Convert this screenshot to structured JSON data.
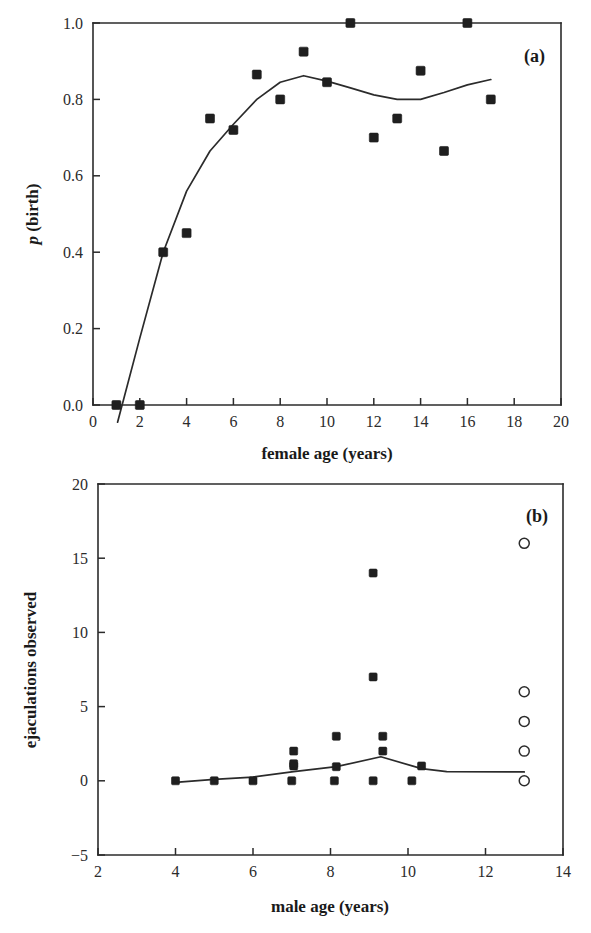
{
  "figure": {
    "background": "#ffffff",
    "ink_color": "#1f1f1f",
    "panel_count": 2
  },
  "chart_data": [
    {
      "panel": "a",
      "tag": "(a)",
      "type": "scatter",
      "title": "",
      "xlabel": "female age (years)",
      "ylabel": "p (birth)",
      "ylabel_parts": {
        "italic": "p",
        "rest": " (birth)"
      },
      "xlim": [
        0,
        20
      ],
      "ylim": [
        0.0,
        1.0
      ],
      "xticks": [
        0,
        2,
        4,
        6,
        8,
        10,
        12,
        14,
        16,
        18,
        20
      ],
      "xticklabels": [
        "0",
        "2",
        "4",
        "6",
        "8",
        "10",
        "12",
        "14",
        "16",
        "18",
        "20"
      ],
      "yticks": [
        0.0,
        0.2,
        0.4,
        0.6,
        0.8,
        1.0
      ],
      "yticklabels": [
        "0.0",
        "0.2",
        "0.4",
        "0.6",
        "0.8",
        "1.0"
      ],
      "grid": false,
      "legend": "none",
      "marker": "filled-square",
      "points": [
        {
          "x": 1,
          "y": 0.0
        },
        {
          "x": 2,
          "y": 0.0
        },
        {
          "x": 3,
          "y": 0.4
        },
        {
          "x": 4,
          "y": 0.45
        },
        {
          "x": 5,
          "y": 0.75
        },
        {
          "x": 6,
          "y": 0.72
        },
        {
          "x": 7,
          "y": 0.865
        },
        {
          "x": 8,
          "y": 0.8
        },
        {
          "x": 9,
          "y": 0.925
        },
        {
          "x": 10,
          "y": 0.845
        },
        {
          "x": 11,
          "y": 1.0
        },
        {
          "x": 12,
          "y": 0.7
        },
        {
          "x": 13,
          "y": 0.75
        },
        {
          "x": 14,
          "y": 0.875
        },
        {
          "x": 15,
          "y": 0.665
        },
        {
          "x": 16,
          "y": 1.0
        },
        {
          "x": 17,
          "y": 0.8
        }
      ],
      "fit_line": [
        {
          "x": 1.05,
          "y": -0.045
        },
        {
          "x": 2.0,
          "y": 0.175
        },
        {
          "x": 3.0,
          "y": 0.4
        },
        {
          "x": 4.0,
          "y": 0.56
        },
        {
          "x": 5.0,
          "y": 0.665
        },
        {
          "x": 6.0,
          "y": 0.735
        },
        {
          "x": 7.0,
          "y": 0.8
        },
        {
          "x": 8.0,
          "y": 0.845
        },
        {
          "x": 9.0,
          "y": 0.862
        },
        {
          "x": 10.0,
          "y": 0.848
        },
        {
          "x": 11.0,
          "y": 0.83
        },
        {
          "x": 12.0,
          "y": 0.812
        },
        {
          "x": 13.0,
          "y": 0.8
        },
        {
          "x": 14.0,
          "y": 0.8
        },
        {
          "x": 15.0,
          "y": 0.818
        },
        {
          "x": 16.0,
          "y": 0.838
        },
        {
          "x": 17.0,
          "y": 0.852
        }
      ]
    },
    {
      "panel": "b",
      "tag": "(b)",
      "type": "scatter",
      "title": "",
      "xlabel": "male age (years)",
      "ylabel": "ejaculations observed",
      "xlim": [
        2,
        14
      ],
      "ylim": [
        -5,
        20
      ],
      "xticks": [
        2,
        4,
        6,
        8,
        10,
        12,
        14
      ],
      "xticklabels": [
        "2",
        "4",
        "6",
        "8",
        "10",
        "12",
        "14"
      ],
      "yticks": [
        -5,
        0,
        5,
        10,
        15,
        20
      ],
      "yticklabels": [
        "−5",
        "0",
        "5",
        "10",
        "15",
        "20"
      ],
      "grid": false,
      "legend": "none",
      "markers": {
        "filled": "filled-square",
        "open": "open-circle"
      },
      "points_filled": [
        {
          "x": 4.0,
          "y": 0.0
        },
        {
          "x": 5.0,
          "y": 0.0
        },
        {
          "x": 6.0,
          "y": 0.0
        },
        {
          "x": 7.0,
          "y": 0.0
        },
        {
          "x": 7.05,
          "y": 1.0
        },
        {
          "x": 7.05,
          "y": 1.15
        },
        {
          "x": 7.05,
          "y": 2.0
        },
        {
          "x": 8.1,
          "y": 0.0
        },
        {
          "x": 8.15,
          "y": 0.95
        },
        {
          "x": 8.15,
          "y": 3.0
        },
        {
          "x": 9.1,
          "y": 0.0
        },
        {
          "x": 9.1,
          "y": 7.0
        },
        {
          "x": 9.1,
          "y": 14.0
        },
        {
          "x": 9.35,
          "y": 2.0
        },
        {
          "x": 9.35,
          "y": 3.0
        },
        {
          "x": 10.1,
          "y": 0.0
        },
        {
          "x": 10.35,
          "y": 1.0
        }
      ],
      "points_open": [
        {
          "x": 13.0,
          "y": 0.0
        },
        {
          "x": 13.0,
          "y": 2.0
        },
        {
          "x": 13.0,
          "y": 4.0
        },
        {
          "x": 13.0,
          "y": 6.0
        },
        {
          "x": 13.0,
          "y": 16.0
        }
      ],
      "fit_line": [
        {
          "x": 4.0,
          "y": -0.1
        },
        {
          "x": 5.0,
          "y": 0.1
        },
        {
          "x": 6.0,
          "y": 0.25
        },
        {
          "x": 7.05,
          "y": 0.62
        },
        {
          "x": 8.15,
          "y": 0.95
        },
        {
          "x": 9.3,
          "y": 1.62
        },
        {
          "x": 10.35,
          "y": 0.82
        },
        {
          "x": 11.0,
          "y": 0.62
        },
        {
          "x": 13.0,
          "y": 0.6
        }
      ]
    }
  ]
}
